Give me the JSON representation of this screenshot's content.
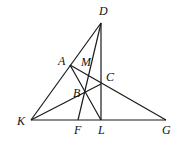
{
  "diagram": {
    "type": "geometry",
    "points": {
      "D": {
        "x": 101,
        "y": 23,
        "label": "D",
        "lx": 99,
        "ly": 15
      },
      "A": {
        "x": 70,
        "y": 65,
        "label": "A",
        "lx": 58,
        "ly": 65
      },
      "M": {
        "x": 89,
        "y": 72,
        "label": "M",
        "lx": 81,
        "ly": 65
      },
      "C": {
        "x": 101,
        "y": 84,
        "label": "C",
        "lx": 106,
        "ly": 81
      },
      "B": {
        "x": 86,
        "y": 93,
        "label": "B",
        "lx": 73,
        "ly": 96
      },
      "K": {
        "x": 31,
        "y": 120,
        "label": "K",
        "lx": 17,
        "ly": 125
      },
      "F": {
        "x": 78,
        "y": 120,
        "label": "F",
        "lx": 74,
        "ly": 133
      },
      "L": {
        "x": 101,
        "y": 120,
        "label": "L",
        "lx": 98,
        "ly": 133
      },
      "G": {
        "x": 166,
        "y": 120,
        "label": "G",
        "lx": 162,
        "ly": 133
      }
    },
    "segments": [
      [
        "K",
        "D"
      ],
      [
        "K",
        "G"
      ],
      [
        "D",
        "L"
      ],
      [
        "D",
        "F"
      ],
      [
        "A",
        "G"
      ],
      [
        "A",
        "L"
      ],
      [
        "K",
        "C"
      ]
    ]
  }
}
